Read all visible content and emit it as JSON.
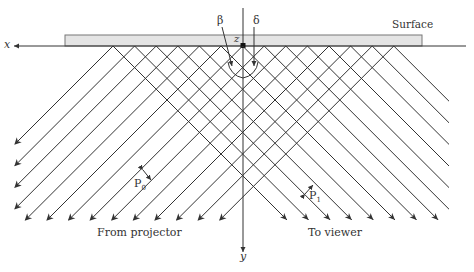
{
  "diagram": {
    "type": "fringe projection geometry",
    "labels": {
      "x_axis": "x",
      "y_axis": "y",
      "z_point": "z",
      "surface": "Surface",
      "beta": "β",
      "delta": "δ",
      "p0_main": "P",
      "p0_sub": "0",
      "p1_main": "P",
      "p1_sub": "1",
      "from_projector": "From projector",
      "to_viewer": "To viewer"
    },
    "geometry": {
      "surface_rect": {
        "x": 65,
        "y": 35,
        "w": 357,
        "h": 11
      },
      "axis_y": 46,
      "axis_x_start": 8,
      "axis_x_end": 466,
      "origin_x": 243,
      "vertical_axis_top": 8,
      "vertical_axis_bottom": 252,
      "hit_start_x": 113,
      "hit_spacing": 21.6,
      "hit_count": 14,
      "left_bound_x": 15,
      "right_bound_x": 449,
      "bottom_y": 220
    },
    "colors": {
      "line": "#333333",
      "surface_fill": "#e4e4e4",
      "surface_stroke": "#777777",
      "text": "#333333"
    }
  }
}
